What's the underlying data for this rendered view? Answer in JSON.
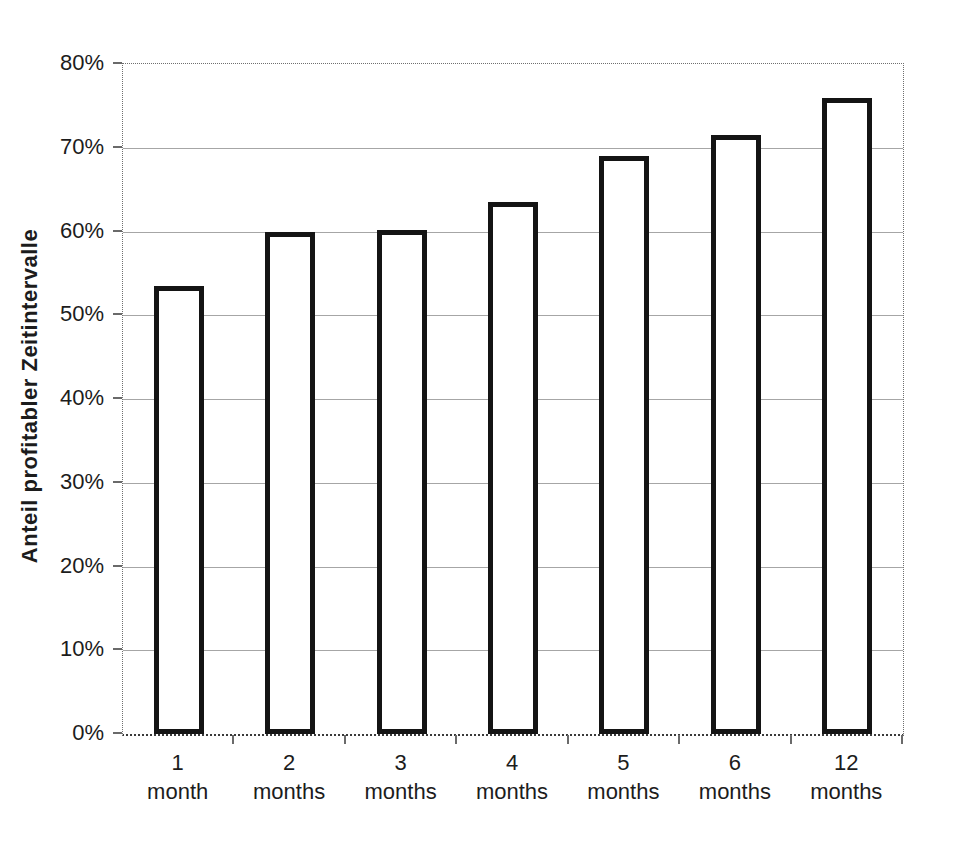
{
  "figure": {
    "background": "#ffffff"
  },
  "chart_data": {
    "type": "bar",
    "title": "",
    "xlabel": "",
    "ylabel": "Anteil profitabler Zeitintervalle",
    "ylim": [
      0,
      80
    ],
    "ytick_step": 10,
    "ytick_labels": [
      "0%",
      "10%",
      "20%",
      "30%",
      "40%",
      "50%",
      "60%",
      "70%",
      "80%"
    ],
    "categories": [
      {
        "line1": "1",
        "line2": "month"
      },
      {
        "line1": "2",
        "line2": "months"
      },
      {
        "line1": "3",
        "line2": "months"
      },
      {
        "line1": "4",
        "line2": "months"
      },
      {
        "line1": "5",
        "line2": "months"
      },
      {
        "line1": "6",
        "line2": "months"
      },
      {
        "line1": "12",
        "line2": "months"
      }
    ],
    "values": [
      53.5,
      60.0,
      60.2,
      63.5,
      69.0,
      71.5,
      76.0
    ],
    "grid": true,
    "legend": false,
    "colors": {
      "bar_fill": "#ffffff",
      "bar_border": "#141414",
      "gridline": "#a6a6a6",
      "axis": "#6a6a6a",
      "plot_border": "#6f6f6f",
      "text": "#1c1c1c"
    }
  }
}
